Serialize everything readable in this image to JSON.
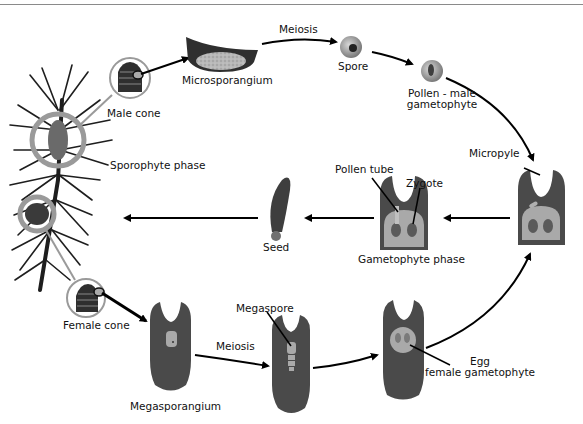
{
  "diagram": {
    "colors": {
      "tissue_dark": "#4a4a4a",
      "gametophyte_light": "#a9a9a9",
      "ring": "#9a9a9a",
      "arrow": "#000000",
      "background": "#ffffff"
    },
    "labels": {
      "male_cone": "Male cone",
      "microsporangium": "Microsporangium",
      "meiosis_top": "Meiosis",
      "spore": "Spore",
      "pollen_line1": "Pollen - male",
      "pollen_line2": "gametophyte",
      "sporophyte_phase": "Sporophyte phase",
      "micropyle": "Micropyle",
      "pollen_tube": "Pollen tube",
      "zygote": "Zygote",
      "gametophyte_phase": "Gametophyte phase",
      "seed": "Seed",
      "female_cone": "Female cone",
      "megasporangium": "Megasporangium",
      "meiosis_bottom": "Meiosis",
      "megaspore": "Megaspore",
      "egg_line1": "Egg",
      "egg_line2": "female gametophyte"
    },
    "nodes": [
      {
        "id": "sporophyte",
        "label_key": "sporophyte_phase",
        "icon": "pine-branch-icon"
      },
      {
        "id": "male-cone",
        "label_key": "male_cone",
        "icon": "male-cone-icon"
      },
      {
        "id": "microsporangium",
        "label_key": "microsporangium",
        "icon": "microsporangium-icon"
      },
      {
        "id": "spore",
        "label_key": "spore",
        "icon": "spore-icon"
      },
      {
        "id": "pollen",
        "label_key": "pollen_line1",
        "icon": "pollen-icon"
      },
      {
        "id": "ovule-pollinated",
        "label_key": "micropyle",
        "icon": "ovule-icon"
      },
      {
        "id": "ovule-fertilized",
        "label_key": "gametophyte_phase",
        "icon": "ovule-icon"
      },
      {
        "id": "seed",
        "label_key": "seed",
        "icon": "seed-icon"
      },
      {
        "id": "female-cone",
        "label_key": "female_cone",
        "icon": "female-cone-icon"
      },
      {
        "id": "megasporangium",
        "label_key": "megasporangium",
        "icon": "ovule-icon"
      },
      {
        "id": "megaspore",
        "label_key": "megaspore",
        "icon": "ovule-icon"
      },
      {
        "id": "egg",
        "label_key": "egg_line1",
        "icon": "ovule-icon"
      }
    ],
    "edges": [
      {
        "from": "male-cone",
        "to": "microsporangium"
      },
      {
        "from": "microsporangium",
        "to": "spore",
        "label_key": "meiosis_top"
      },
      {
        "from": "spore",
        "to": "pollen"
      },
      {
        "from": "pollen",
        "to": "ovule-pollinated"
      },
      {
        "from": "ovule-pollinated",
        "to": "ovule-fertilized"
      },
      {
        "from": "ovule-fertilized",
        "to": "seed"
      },
      {
        "from": "seed",
        "to": "sporophyte"
      },
      {
        "from": "female-cone",
        "to": "megasporangium"
      },
      {
        "from": "megasporangium",
        "to": "megaspore",
        "label_key": "meiosis_bottom"
      },
      {
        "from": "megaspore",
        "to": "egg"
      },
      {
        "from": "egg",
        "to": "ovule-pollinated"
      }
    ]
  }
}
